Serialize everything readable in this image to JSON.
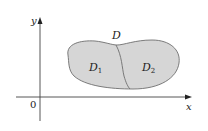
{
  "diagram": {
    "region_label": "D",
    "subregions": [
      {
        "label": "D",
        "subscript": "1"
      },
      {
        "label": "D",
        "subscript": "2"
      }
    ],
    "axes": {
      "x_label": "x",
      "y_label": "y",
      "origin_label": "0"
    },
    "colors": {
      "region_fill": "#d6d6d6",
      "region_stroke": "#6e6e6e",
      "axis": "#444444",
      "text": "#222222"
    }
  }
}
